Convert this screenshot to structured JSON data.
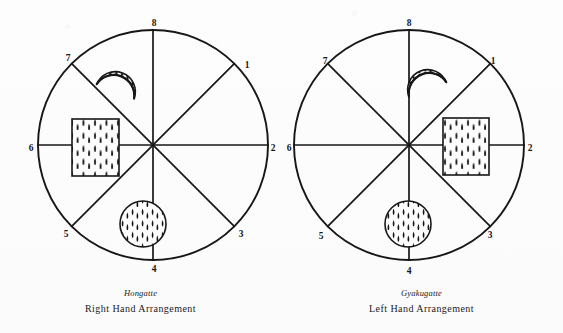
{
  "figure": {
    "type": "diagram",
    "background_color": "#fcfcfc",
    "ink_color": "#1a1a1a",
    "panels": [
      {
        "id": "hongatte",
        "caption_japanese": "Hongatte",
        "caption_english": "Right Hand Arrangement",
        "circle": {
          "cx": 153,
          "cy": 145,
          "r": 115
        },
        "divisions": 8,
        "position_labels": [
          "1",
          "2",
          "3",
          "4",
          "5",
          "6",
          "7",
          "8"
        ],
        "label_points": [
          {
            "label": "1",
            "x": 247,
            "y": 68
          },
          {
            "label": "2",
            "x": 273,
            "y": 151
          },
          {
            "label": "3",
            "x": 241,
            "y": 234
          },
          {
            "label": "4",
            "x": 154,
            "y": 270
          },
          {
            "label": "5",
            "x": 66,
            "y": 234
          },
          {
            "label": "6",
            "x": 31,
            "y": 151
          },
          {
            "label": "7",
            "x": 68,
            "y": 58
          },
          {
            "label": "8",
            "x": 154,
            "y": 23
          }
        ],
        "objects": [
          {
            "name": "crescent-ladle",
            "shape": "crescent",
            "hatched": true,
            "cx": 115,
            "cy": 96,
            "opens": "upper-right"
          },
          {
            "name": "hatched-rectangle-board",
            "shape": "rectangle",
            "hatched": true,
            "x": 72,
            "y": 119,
            "w": 47,
            "h": 57
          },
          {
            "name": "hatched-circle-brazier",
            "shape": "circle",
            "hatched": true,
            "cx": 143,
            "cy": 224,
            "r": 23
          }
        ]
      },
      {
        "id": "gyakugatte",
        "caption_japanese": "Gyakugatte",
        "caption_english": "Left Hand Arrangement",
        "circle": {
          "cx": 128,
          "cy": 145,
          "r": 115
        },
        "divisions": 8,
        "position_labels": [
          "1",
          "2",
          "3",
          "4",
          "5",
          "6",
          "7",
          "8"
        ],
        "label_points": [
          {
            "label": "1",
            "x": 212,
            "y": 62
          },
          {
            "label": "2",
            "x": 249,
            "y": 151
          },
          {
            "label": "3",
            "x": 209,
            "y": 235
          },
          {
            "label": "4",
            "x": 128,
            "y": 272
          },
          {
            "label": "5",
            "x": 38,
            "y": 237
          },
          {
            "label": "6",
            "x": 7,
            "y": 151
          },
          {
            "label": "7",
            "x": 43,
            "y": 62
          },
          {
            "label": "8",
            "x": 128,
            "y": 23
          }
        ],
        "objects": [
          {
            "name": "crescent-ladle",
            "shape": "crescent",
            "hatched": true,
            "cx": 146,
            "cy": 94,
            "opens": "lower-left"
          },
          {
            "name": "hatched-rectangle-board",
            "shape": "rectangle",
            "hatched": true,
            "x": 162,
            "y": 118,
            "w": 46,
            "h": 57
          },
          {
            "name": "hatched-circle-brazier",
            "shape": "circle",
            "hatched": true,
            "cx": 127,
            "cy": 224,
            "r": 23
          }
        ]
      }
    ]
  }
}
